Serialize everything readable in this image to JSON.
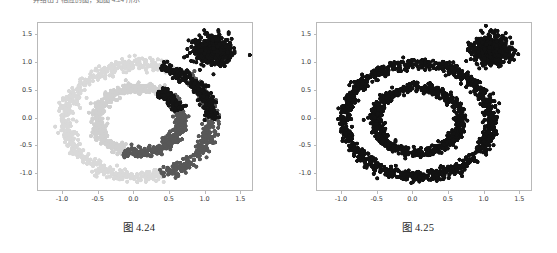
{
  "page": {
    "background": "#ffffff",
    "top_text_sliver": "并给出了相应的图，如图 4.24 所示"
  },
  "figures": [
    {
      "id": "figure-left",
      "caption": "图 4.24",
      "chart_data": {
        "type": "scatter",
        "title": "",
        "xlabel": "",
        "ylabel": "",
        "xlim": [
          -1.35,
          1.68
        ],
        "ylim": [
          -1.32,
          1.72
        ],
        "grid": false,
        "legend": false,
        "xticks": [
          "-1.0",
          "-0.5",
          "0.0",
          "0.5",
          "1.0",
          "1.5"
        ],
        "xtick_values": [
          -1.0,
          -0.5,
          0.0,
          0.5,
          1.0,
          1.5
        ],
        "yticks": [
          "1.5",
          "1.0",
          "0.5",
          "0.0",
          "-0.5",
          "-1.0"
        ],
        "ytick_values": [
          1.5,
          1.0,
          0.5,
          0.0,
          -0.5,
          -1.0
        ],
        "marker": "circle",
        "marker_size": 2.1,
        "series": [
          {
            "name": "cluster-light-gray-outer-left",
            "color": "#d9d9d9",
            "shape": "ring-arc",
            "center": [
              0.08,
              -0.05
            ],
            "radius": 1.04,
            "radius_jitter": 0.085,
            "angle_start": 55,
            "angle_end": 290,
            "n_points": 620
          },
          {
            "name": "cluster-light-gray-inner-left",
            "color": "#d0d0d0",
            "shape": "ring-arc",
            "center": [
              0.08,
              -0.05
            ],
            "radius": 0.6,
            "radius_jitter": 0.075,
            "angle_start": 60,
            "angle_end": 250,
            "n_points": 420
          },
          {
            "name": "cluster-dark-gray-inner-right",
            "color": "#585858",
            "shape": "ring-arc",
            "center": [
              0.08,
              -0.05
            ],
            "radius": 0.6,
            "radius_jitter": 0.075,
            "angle_start": -110,
            "angle_end": 60,
            "n_points": 400
          },
          {
            "name": "cluster-dark-gray-outer-bottom",
            "color": "#585858",
            "shape": "ring-arc",
            "center": [
              0.08,
              -0.05
            ],
            "radius": 1.04,
            "radius_jitter": 0.085,
            "angle_start": -72,
            "angle_end": 55,
            "n_points": 360
          },
          {
            "name": "cluster-black-outer-top",
            "color": "#141414",
            "shape": "ring-arc",
            "center": [
              0.08,
              -0.05
            ],
            "radius": 1.04,
            "radius_jitter": 0.085,
            "angle_start": 0,
            "angle_end": 72,
            "n_points": 230
          },
          {
            "name": "cluster-black-inner-top",
            "color": "#141414",
            "shape": "ring-arc",
            "center": [
              0.08,
              -0.05
            ],
            "radius": 0.6,
            "radius_jitter": 0.075,
            "angle_start": 18,
            "angle_end": 62,
            "n_points": 130
          },
          {
            "name": "cluster-black-blob",
            "color": "#141414",
            "shape": "gaussian-blob",
            "center": [
              1.12,
              1.22
            ],
            "spread": 0.135,
            "n_points": 470
          }
        ]
      }
    },
    {
      "id": "figure-right",
      "caption": "图 4.25",
      "chart_data": {
        "type": "scatter",
        "title": "",
        "xlabel": "",
        "ylabel": "",
        "xlim": [
          -1.35,
          1.68
        ],
        "ylim": [
          -1.32,
          1.72
        ],
        "grid": false,
        "legend": false,
        "xticks": [
          "-1.0",
          "-0.5",
          "0.0",
          "0.5",
          "1.0",
          "1.5"
        ],
        "xtick_values": [
          -1.0,
          -0.5,
          0.0,
          0.5,
          1.0,
          1.5
        ],
        "yticks": [
          "1.5",
          "1.0",
          "0.5",
          "0.0",
          "-0.5",
          "-1.0"
        ],
        "ytick_values": [
          1.5,
          1.0,
          0.5,
          0.0,
          -0.5,
          -1.0
        ],
        "marker": "circle",
        "marker_size": 2.1,
        "series": [
          {
            "name": "cluster-black-outer-ring",
            "color": "#121212",
            "shape": "ring-arc",
            "center": [
              0.08,
              -0.05
            ],
            "radius": 1.04,
            "radius_jitter": 0.085,
            "angle_start": -180,
            "angle_end": 180,
            "n_points": 980
          },
          {
            "name": "cluster-black-inner-ring",
            "color": "#121212",
            "shape": "ring-arc",
            "center": [
              0.08,
              -0.05
            ],
            "radius": 0.6,
            "radius_jitter": 0.075,
            "angle_start": -180,
            "angle_end": 180,
            "n_points": 700
          },
          {
            "name": "cluster-black-blob",
            "color": "#121212",
            "shape": "gaussian-blob",
            "center": [
              1.12,
              1.22
            ],
            "spread": 0.135,
            "n_points": 470
          }
        ]
      }
    }
  ]
}
